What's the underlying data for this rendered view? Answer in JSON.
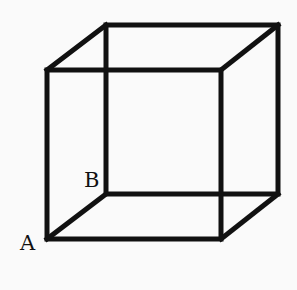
{
  "diagram": {
    "type": "cube-wireframe",
    "labels": {
      "A": "A",
      "B": "B"
    },
    "stroke_color": "#111111",
    "background": "#fafafa"
  }
}
